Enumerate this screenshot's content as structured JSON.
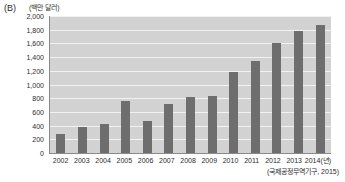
{
  "panel": {
    "label": "(B)"
  },
  "chart_data": {
    "type": "bar",
    "title": "",
    "subtitle": "",
    "unit_label": "(백만 달러)",
    "xlabel": "(년)",
    "ylabel": "",
    "x_axis_last_tick": "2014(년)",
    "categories": [
      "2002",
      "2003",
      "2004",
      "2005",
      "2006",
      "2007",
      "2008",
      "2009",
      "2010",
      "2011",
      "2012",
      "2013",
      "2014"
    ],
    "values": [
      280,
      380,
      430,
      760,
      465,
      710,
      825,
      835,
      1190,
      1350,
      1600,
      1775,
      1875
    ],
    "ylim": [
      0,
      2000
    ],
    "ytick_step": 200,
    "ytick_labels": [
      "2,000",
      "1,800",
      "1,600",
      "1,400",
      "1,200",
      "1,000",
      "800",
      "600",
      "400",
      "200",
      "0"
    ],
    "ytick_values": [
      2000,
      1800,
      1600,
      1400,
      1200,
      1000,
      800,
      600,
      400,
      200,
      0
    ],
    "grid": true,
    "legend": false,
    "legend_position": "none",
    "source_note": "(국제공정무역기구, 2015)",
    "colors": {
      "bar": "#6e6e6e",
      "plot_background": "#d2d2d2",
      "gridline": "#f2f2f2",
      "axis": "#8a8a8a",
      "text": "#2b2b2b"
    }
  }
}
